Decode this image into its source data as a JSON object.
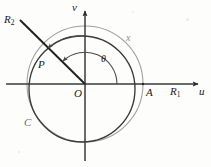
{
  "figure": {
    "background_color": "#fdfdfc",
    "stroke_dark": "#2b2b2b",
    "stroke_light": "#9a9a9a",
    "stroke_mid": "#6d6d6d"
  },
  "axes": {
    "horizontal": {
      "name": "u-axis",
      "label": "u",
      "axis_label_real": "R",
      "axis_label_sub": "1",
      "origin_label": "O"
    },
    "vertical": {
      "name": "v-axis",
      "label": "v"
    }
  },
  "labels": {
    "v_axis": "v",
    "u_axis": "u",
    "origin": "O",
    "R1_base": "R",
    "R1_sub": "1",
    "R2_base": "R",
    "R2_sub": "2",
    "point_P": "P",
    "point_A": "A",
    "curve_C": "C",
    "curve_x": "x",
    "angle_theta": "θ"
  },
  "geometry": {
    "origin": {
      "x": 85,
      "y": 84
    },
    "outer_circle": {
      "name": "circle-x",
      "cx": 85,
      "cy": 84,
      "r": 58,
      "color": "#9a9a9a"
    },
    "inner_circle": {
      "name": "circle-C",
      "cx": 82,
      "cy": 89,
      "r": 53,
      "color": "#3a3a3a"
    },
    "ray_R2": {
      "name": "ray-R2",
      "x1": 196,
      "y1": 84,
      "x2": 22,
      "y2": 22,
      "angle_deg": 150
    },
    "point_P": {
      "x": 44,
      "y": 58
    },
    "point_A": {
      "x": 143,
      "y": 84
    },
    "theta_arc_inner": {
      "r": 30,
      "start_deg": 0,
      "end_deg": 150
    },
    "theta_arc_outer": {
      "r": 48,
      "start_deg": 90,
      "end_deg": 150
    }
  },
  "annotations": [
    {
      "name": "theta-angle-label",
      "text": "θ"
    },
    {
      "name": "ray-label-R2",
      "text": "R2"
    },
    {
      "name": "axis-label-R1",
      "text": "R1"
    },
    {
      "name": "point-label-P",
      "text": "P"
    },
    {
      "name": "point-label-A",
      "text": "A"
    },
    {
      "name": "curve-label-C",
      "text": "C"
    },
    {
      "name": "curve-label-x",
      "text": "x"
    }
  ]
}
